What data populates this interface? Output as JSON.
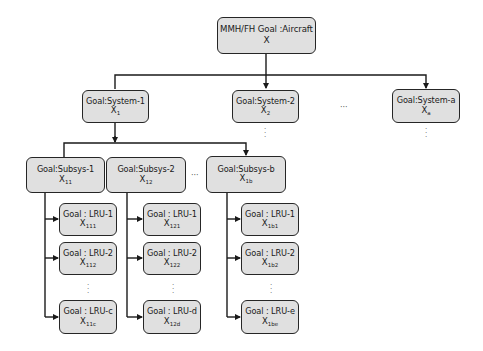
{
  "diagram": {
    "root": {
      "label": "MMH/FH Goal :Aircraft",
      "var": "X",
      "sub": ""
    },
    "systems": [
      {
        "label": "Goal:System-1",
        "var": "X",
        "sub": "1"
      },
      {
        "label": "Goal:System-2",
        "var": "X",
        "sub": "2"
      },
      {
        "label": "Goal:System-a",
        "var": "X",
        "sub": "a"
      }
    ],
    "subsystems": [
      {
        "label": "Goal:Subsys-1",
        "var": "X",
        "sub": "11"
      },
      {
        "label": "Goal:Subsys-2",
        "var": "X",
        "sub": "12"
      },
      {
        "label": "Goal:Subsys-b",
        "var": "X",
        "sub": "1b"
      }
    ],
    "lrus": [
      [
        {
          "label": "Goal : LRU-1",
          "var": "X",
          "sub": "111"
        },
        {
          "label": "Goal : LRU-2",
          "var": "X",
          "sub": "112"
        },
        {
          "label": "Goal : LRU-c",
          "var": "X",
          "sub": "11c"
        }
      ],
      [
        {
          "label": "Goal : LRU-1",
          "var": "X",
          "sub": "121"
        },
        {
          "label": "Goal : LRU-2",
          "var": "X",
          "sub": "122"
        },
        {
          "label": "Goal : LRU-d",
          "var": "X",
          "sub": "12d"
        }
      ],
      [
        {
          "label": "Goal : LRU-1",
          "var": "X",
          "sub": "1b1"
        },
        {
          "label": "Goal : LRU-2",
          "var": "X",
          "sub": "1b2"
        },
        {
          "label": "Goal : LRU-e",
          "var": "X",
          "sub": "1be"
        }
      ]
    ],
    "ellipsis_h": "···",
    "ellipsis_v": "⋮",
    "colors": {
      "box_fill": "#e0e0e0",
      "box_border": "#262626",
      "line": "#1a1a1a"
    }
  }
}
